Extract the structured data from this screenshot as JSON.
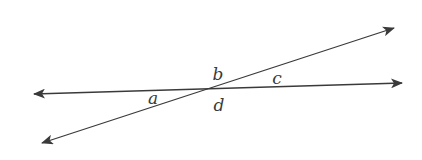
{
  "diagram": {
    "line_color": "#3a3a3a",
    "intersection": {
      "x": 209,
      "y": 89
    },
    "lines": [
      {
        "name": "horizontal-line",
        "from": {
          "x": 34,
          "y": 94
        },
        "to": {
          "x": 402,
          "y": 83
        }
      },
      {
        "name": "slanted-line",
        "from": {
          "x": 42,
          "y": 143
        },
        "to": {
          "x": 394,
          "y": 28
        }
      }
    ],
    "angle_labels": {
      "a": {
        "text": "a",
        "x": 153,
        "y": 104
      },
      "b": {
        "text": "b",
        "x": 218,
        "y": 80
      },
      "c": {
        "text": "c",
        "x": 277,
        "y": 84
      },
      "d": {
        "text": "d",
        "x": 219,
        "y": 111
      }
    }
  }
}
